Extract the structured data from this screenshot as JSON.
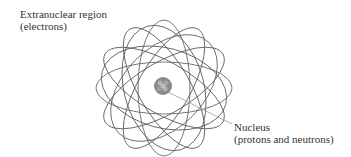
{
  "labels": {
    "extranuclear": {
      "line1": "Extranuclear region",
      "line2": "(electrons)"
    },
    "nucleus": {
      "line1": "Nucleus",
      "line2": "(protons and neutrons)"
    }
  },
  "colors": {
    "orbit": "#555555",
    "nucleus": "#8a8a8a",
    "text": "#333333",
    "leader": "#999999"
  }
}
